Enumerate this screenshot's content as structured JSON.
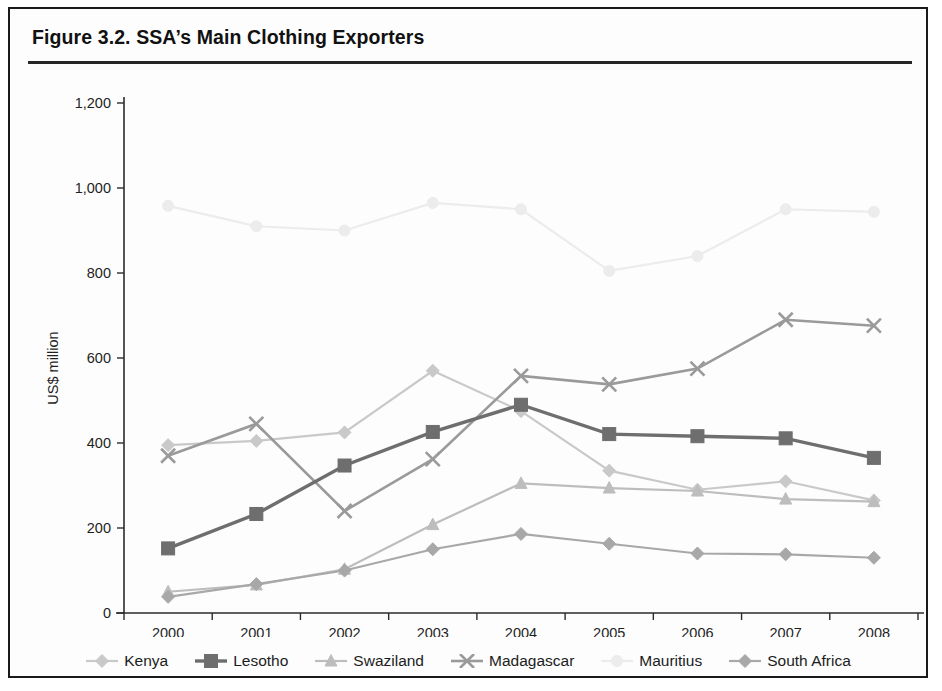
{
  "figure": {
    "title": "Figure 3.2. SSA’s Main Clothing Exporters"
  },
  "chart_data": {
    "type": "line",
    "title": "Figure 3.2. SSA’s Main Clothing Exporters",
    "xlabel": "",
    "ylabel": "US$ million",
    "x": [
      "2000",
      "2001",
      "2002",
      "2003",
      "2004",
      "2005",
      "2006",
      "2007",
      "2008"
    ],
    "categories": [
      "2000",
      "2001",
      "2002",
      "2003",
      "2004",
      "2005",
      "2006",
      "2007",
      "2008"
    ],
    "ylim": [
      0,
      1200
    ],
    "yticks": [
      0,
      200,
      400,
      600,
      800,
      1000,
      1200
    ],
    "ytick_labels": [
      "0",
      "200",
      "400",
      "600",
      "800",
      "1,000",
      "1,200"
    ],
    "grid": false,
    "legend_position": "bottom",
    "series": [
      {
        "name": "Kenya",
        "color": "#c9c9c9",
        "marker": "diamond",
        "width": 2.2,
        "values": [
          395,
          405,
          425,
          570,
          475,
          335,
          290,
          310,
          265
        ]
      },
      {
        "name": "Lesotho",
        "color": "#6e6e6e",
        "marker": "square",
        "width": 3.4,
        "values": [
          152,
          233,
          347,
          426,
          490,
          421,
          416,
          411,
          365
        ]
      },
      {
        "name": "Swaziland",
        "color": "#bdbdbd",
        "marker": "triangle",
        "width": 2.2,
        "values": [
          50,
          66,
          103,
          208,
          305,
          294,
          287,
          268,
          262
        ]
      },
      {
        "name": "Madagascar",
        "color": "#9a9a9a",
        "marker": "x",
        "width": 2.6,
        "values": [
          370,
          445,
          240,
          362,
          558,
          538,
          575,
          690,
          676
        ]
      },
      {
        "name": "Mauritius",
        "color": "#ececec",
        "marker": "circle",
        "width": 2.2,
        "values": [
          958,
          910,
          900,
          965,
          950,
          805,
          840,
          950,
          944
        ]
      },
      {
        "name": "South Africa",
        "color": "#a8a8a8",
        "marker": "diamond",
        "width": 2.2,
        "values": [
          38,
          68,
          100,
          150,
          186,
          163,
          140,
          138,
          130
        ]
      }
    ]
  },
  "legend": {
    "items": [
      {
        "label": "Kenya",
        "color": "#c9c9c9",
        "marker": "diamond"
      },
      {
        "label": "Lesotho",
        "color": "#6e6e6e",
        "marker": "square"
      },
      {
        "label": "Swaziland",
        "color": "#bdbdbd",
        "marker": "triangle"
      },
      {
        "label": "Madagascar",
        "color": "#9a9a9a",
        "marker": "x"
      },
      {
        "label": "Mauritius",
        "color": "#ececec",
        "marker": "circle"
      },
      {
        "label": "South Africa",
        "color": "#a8a8a8",
        "marker": "diamond"
      }
    ]
  }
}
